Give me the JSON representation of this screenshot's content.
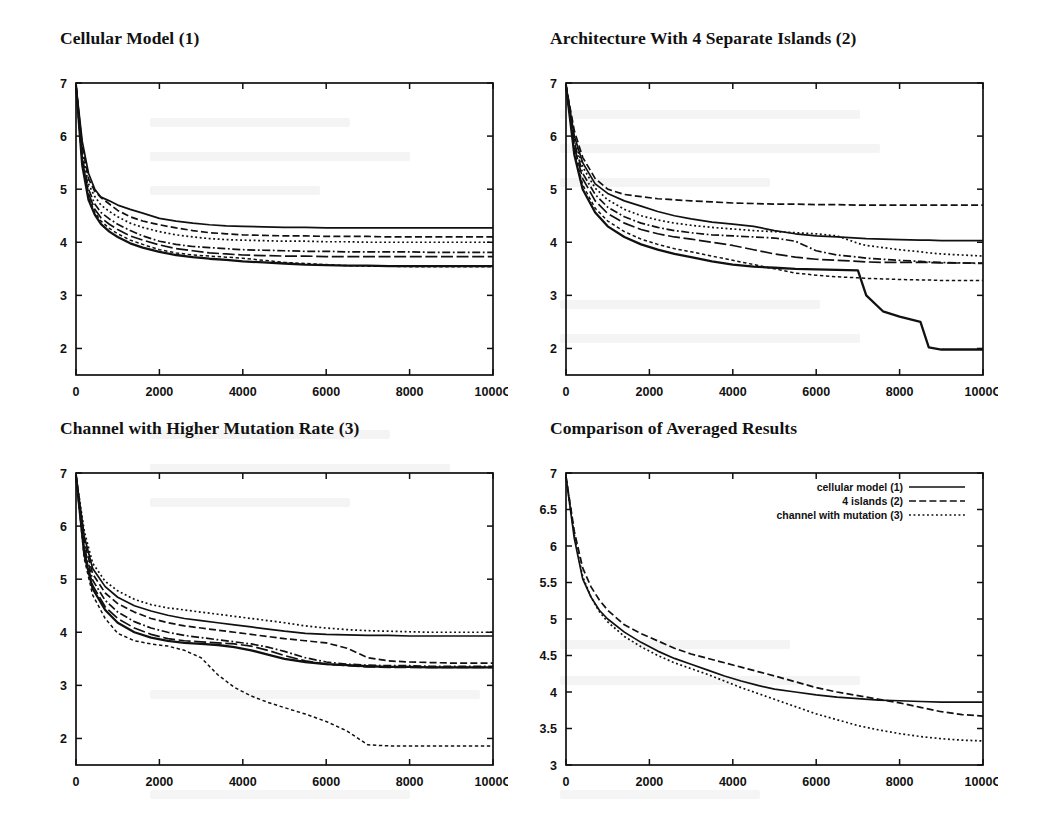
{
  "figure": {
    "background_color": "#ffffff",
    "ink_color": "#111111"
  },
  "panels": [
    {
      "id": "cellular-model",
      "title": "Cellular Model (1)"
    },
    {
      "id": "four-islands",
      "title": "Architecture With 4 Separate Islands (2)"
    },
    {
      "id": "channel-mutation",
      "title": "Channel with Higher Mutation Rate (3)"
    },
    {
      "id": "comparison",
      "title": "Comparison of Averaged Results"
    }
  ],
  "axes": {
    "x_tick_labels": [
      "0",
      "2000",
      "4000",
      "6000",
      "8000",
      "1000C"
    ],
    "x_tick_values": [
      0,
      2000,
      4000,
      6000,
      8000,
      10000
    ],
    "y_tick_labels_runs": [
      "2",
      "3",
      "4",
      "5",
      "6",
      "7"
    ],
    "y_tick_values_runs": [
      2,
      3,
      4,
      5,
      6,
      7
    ],
    "y_tick_labels_comparison": [
      "3",
      "3.5",
      "4",
      "4.5",
      "5",
      "5.5",
      "6",
      "6.5",
      "7"
    ],
    "y_tick_values_comparison": [
      3,
      3.5,
      4,
      4.5,
      5,
      5.5,
      6,
      6.5,
      7
    ]
  },
  "legend": {
    "position": "top-right-inside",
    "entries": [
      {
        "label": "cellular model (1)",
        "dash": "solid"
      },
      {
        "label": "4 islands (2)",
        "dash": "dash"
      },
      {
        "label": "channel with mutation (3)",
        "dash": "dot"
      }
    ]
  },
  "chart_data": [
    {
      "type": "line",
      "title": "Cellular Model (1)",
      "xlabel": "",
      "ylabel": "",
      "xlim": [
        0,
        10000
      ],
      "ylim": [
        1.5,
        7
      ],
      "grid": false,
      "legend": "none",
      "x": [
        0,
        150,
        300,
        450,
        600,
        800,
        1000,
        1300,
        1600,
        2000,
        2400,
        2800,
        3200,
        3600,
        4000,
        4500,
        5000,
        5500,
        6000,
        6500,
        7000,
        7500,
        8000,
        8500,
        9000,
        9500,
        10000
      ],
      "series": [
        {
          "name": "run 1",
          "dash": "solid",
          "values": [
            6.95,
            5.9,
            5.3,
            5.0,
            4.85,
            4.78,
            4.7,
            4.62,
            4.55,
            4.45,
            4.4,
            4.36,
            4.33,
            4.31,
            4.3,
            4.29,
            4.28,
            4.28,
            4.27,
            4.27,
            4.27,
            4.27,
            4.27,
            4.27,
            4.27,
            4.27,
            4.27
          ]
        },
        {
          "name": "run 2",
          "dash": "dash",
          "values": [
            6.95,
            5.8,
            5.2,
            4.96,
            4.84,
            4.72,
            4.6,
            4.48,
            4.4,
            4.33,
            4.27,
            4.22,
            4.18,
            4.16,
            4.14,
            4.13,
            4.12,
            4.12,
            4.11,
            4.11,
            4.11,
            4.1,
            4.1,
            4.1,
            4.1,
            4.1,
            4.1
          ]
        },
        {
          "name": "run 3",
          "dash": "dot",
          "values": [
            6.95,
            5.7,
            5.1,
            4.86,
            4.7,
            4.58,
            4.48,
            4.36,
            4.28,
            4.2,
            4.14,
            4.1,
            4.07,
            4.05,
            4.04,
            4.03,
            4.02,
            4.02,
            4.01,
            4.01,
            4.0,
            4.0,
            4.0,
            4.0,
            4.0,
            4.0,
            4.0
          ]
        },
        {
          "name": "run 4",
          "dash": "dashdot",
          "values": [
            6.95,
            5.6,
            5.0,
            4.72,
            4.56,
            4.44,
            4.34,
            4.22,
            4.12,
            4.02,
            3.96,
            3.92,
            3.9,
            3.88,
            3.86,
            3.85,
            3.84,
            3.83,
            3.83,
            3.82,
            3.82,
            3.82,
            3.82,
            3.81,
            3.81,
            3.81,
            3.81
          ]
        },
        {
          "name": "run 5",
          "dash": "longdash",
          "values": [
            6.95,
            5.55,
            4.92,
            4.62,
            4.46,
            4.34,
            4.24,
            4.12,
            4.04,
            3.95,
            3.88,
            3.84,
            3.8,
            3.78,
            3.76,
            3.75,
            3.74,
            3.74,
            3.73,
            3.73,
            3.73,
            3.73,
            3.73,
            3.73,
            3.73,
            3.73,
            3.73
          ]
        },
        {
          "name": "run 6",
          "dash": "fine",
          "values": [
            6.95,
            5.5,
            4.86,
            4.56,
            4.4,
            4.26,
            4.16,
            4.04,
            3.96,
            3.86,
            3.8,
            3.76,
            3.74,
            3.72,
            3.7,
            3.66,
            3.62,
            3.6,
            3.58,
            3.56,
            3.55,
            3.55,
            3.54,
            3.54,
            3.54,
            3.54,
            3.54
          ]
        },
        {
          "name": "run 7",
          "dash": "thick",
          "values": [
            6.95,
            5.45,
            4.8,
            4.52,
            4.34,
            4.2,
            4.1,
            3.98,
            3.9,
            3.82,
            3.76,
            3.72,
            3.69,
            3.67,
            3.64,
            3.62,
            3.6,
            3.58,
            3.57,
            3.56,
            3.56,
            3.55,
            3.55,
            3.55,
            3.55,
            3.55,
            3.55
          ]
        }
      ]
    },
    {
      "type": "line",
      "title": "Architecture With 4 Separate Islands (2)",
      "xlabel": "",
      "ylabel": "",
      "xlim": [
        0,
        10000
      ],
      "ylim": [
        1.5,
        7
      ],
      "grid": false,
      "legend": "none",
      "x": [
        0,
        200,
        400,
        700,
        1000,
        1400,
        1800,
        2200,
        2600,
        3000,
        3500,
        4000,
        4500,
        5000,
        5500,
        6000,
        6500,
        7000,
        7200,
        7600,
        8000,
        8500,
        8700,
        9000,
        9500,
        10000
      ],
      "series": [
        {
          "name": "run 1",
          "dash": "dash",
          "values": [
            6.95,
            6.1,
            5.6,
            5.2,
            5.0,
            4.9,
            4.86,
            4.82,
            4.8,
            4.78,
            4.76,
            4.74,
            4.73,
            4.72,
            4.72,
            4.71,
            4.71,
            4.7,
            4.7,
            4.7,
            4.7,
            4.7,
            4.7,
            4.7,
            4.7,
            4.7
          ]
        },
        {
          "name": "run 2",
          "dash": "solid",
          "values": [
            6.95,
            6.0,
            5.5,
            5.1,
            4.92,
            4.78,
            4.68,
            4.58,
            4.5,
            4.44,
            4.38,
            4.34,
            4.3,
            4.22,
            4.16,
            4.12,
            4.1,
            4.08,
            4.07,
            4.06,
            4.05,
            4.04,
            4.04,
            4.03,
            4.03,
            4.03
          ]
        },
        {
          "name": "run 3",
          "dash": "dot",
          "values": [
            6.95,
            5.95,
            5.42,
            5.02,
            4.8,
            4.62,
            4.5,
            4.42,
            4.36,
            4.32,
            4.28,
            4.25,
            4.22,
            4.2,
            4.18,
            4.16,
            4.12,
            3.98,
            3.94,
            3.9,
            3.86,
            3.82,
            3.8,
            3.78,
            3.76,
            3.74
          ]
        },
        {
          "name": "run 4",
          "dash": "dashdot",
          "values": [
            6.95,
            5.88,
            5.3,
            4.9,
            4.66,
            4.48,
            4.36,
            4.28,
            4.22,
            4.18,
            4.14,
            4.12,
            4.1,
            4.08,
            4.02,
            3.84,
            3.76,
            3.72,
            3.7,
            3.68,
            3.66,
            3.64,
            3.63,
            3.62,
            3.61,
            3.6
          ]
        },
        {
          "name": "run 5",
          "dash": "longdash",
          "values": [
            6.95,
            5.8,
            5.2,
            4.78,
            4.54,
            4.36,
            4.24,
            4.16,
            4.1,
            4.06,
            4.0,
            3.94,
            3.86,
            3.78,
            3.72,
            3.68,
            3.66,
            3.64,
            3.63,
            3.62,
            3.62,
            3.62,
            3.62,
            3.61,
            3.61,
            3.61
          ]
        },
        {
          "name": "run 6",
          "dash": "fine",
          "values": [
            6.95,
            5.72,
            5.08,
            4.64,
            4.4,
            4.2,
            4.06,
            3.96,
            3.88,
            3.82,
            3.74,
            3.66,
            3.58,
            3.5,
            3.42,
            3.38,
            3.35,
            3.33,
            3.32,
            3.31,
            3.3,
            3.29,
            3.29,
            3.28,
            3.28,
            3.28
          ]
        },
        {
          "name": "run 7",
          "dash": "thick",
          "values": [
            6.95,
            5.65,
            5.0,
            4.56,
            4.3,
            4.1,
            3.96,
            3.86,
            3.78,
            3.72,
            3.64,
            3.58,
            3.54,
            3.52,
            3.5,
            3.49,
            3.48,
            3.47,
            3.0,
            2.7,
            2.6,
            2.5,
            2.02,
            1.98,
            1.98,
            1.98
          ]
        }
      ]
    },
    {
      "type": "line",
      "title": "Channel with Higher Mutation Rate (3)",
      "xlabel": "",
      "ylabel": "",
      "xlim": [
        0,
        10000
      ],
      "ylim": [
        1.5,
        7
      ],
      "grid": false,
      "legend": "none",
      "x": [
        0,
        200,
        400,
        700,
        1000,
        1400,
        1800,
        2200,
        2600,
        3000,
        3400,
        3800,
        4200,
        4600,
        5000,
        5500,
        6000,
        6500,
        7000,
        7500,
        8000,
        8500,
        9000,
        9500,
        10000
      ],
      "series": [
        {
          "name": "run 1",
          "dash": "dot",
          "values": [
            6.95,
            5.9,
            5.3,
            4.96,
            4.78,
            4.62,
            4.52,
            4.46,
            4.42,
            4.38,
            4.34,
            4.3,
            4.26,
            4.22,
            4.18,
            4.12,
            4.08,
            4.05,
            4.03,
            4.02,
            4.01,
            4.0,
            4.0,
            4.0,
            4.0
          ]
        },
        {
          "name": "run 2",
          "dash": "solid",
          "values": [
            6.95,
            5.8,
            5.2,
            4.86,
            4.66,
            4.5,
            4.4,
            4.32,
            4.26,
            4.22,
            4.18,
            4.14,
            4.1,
            4.06,
            4.02,
            3.98,
            3.96,
            3.95,
            3.94,
            3.94,
            3.93,
            3.93,
            3.93,
            3.93,
            3.93
          ]
        },
        {
          "name": "run 3",
          "dash": "dash",
          "values": [
            6.95,
            5.7,
            5.1,
            4.74,
            4.54,
            4.38,
            4.26,
            4.18,
            4.12,
            4.08,
            4.04,
            4.0,
            3.96,
            3.92,
            3.88,
            3.84,
            3.8,
            3.7,
            3.52,
            3.46,
            3.44,
            3.43,
            3.42,
            3.42,
            3.42
          ]
        },
        {
          "name": "run 4",
          "dash": "dashdot",
          "values": [
            6.95,
            5.6,
            4.98,
            4.6,
            4.38,
            4.2,
            4.08,
            4.0,
            3.94,
            3.9,
            3.86,
            3.82,
            3.78,
            3.72,
            3.64,
            3.52,
            3.44,
            3.4,
            3.38,
            3.37,
            3.37,
            3.36,
            3.36,
            3.36,
            3.36
          ]
        },
        {
          "name": "run 5",
          "dash": "longdash",
          "values": [
            6.95,
            5.52,
            4.88,
            4.48,
            4.26,
            4.08,
            3.96,
            3.88,
            3.84,
            3.82,
            3.8,
            3.78,
            3.74,
            3.66,
            3.56,
            3.46,
            3.4,
            3.37,
            3.35,
            3.34,
            3.34,
            3.34,
            3.34,
            3.34,
            3.34
          ]
        },
        {
          "name": "run 6",
          "dash": "thick",
          "values": [
            6.95,
            5.46,
            4.82,
            4.42,
            4.18,
            4.0,
            3.9,
            3.84,
            3.8,
            3.78,
            3.76,
            3.72,
            3.66,
            3.58,
            3.5,
            3.44,
            3.4,
            3.38,
            3.36,
            3.35,
            3.35,
            3.34,
            3.34,
            3.34,
            3.34
          ]
        },
        {
          "name": "run 7",
          "dash": "fine",
          "values": [
            6.95,
            5.38,
            4.7,
            4.26,
            3.98,
            3.84,
            3.78,
            3.74,
            3.66,
            3.52,
            3.2,
            2.96,
            2.8,
            2.68,
            2.58,
            2.46,
            2.32,
            2.14,
            1.88,
            1.86,
            1.86,
            1.86,
            1.86,
            1.86,
            1.86
          ]
        }
      ]
    },
    {
      "type": "line",
      "title": "Comparison of Averaged Results",
      "xlabel": "",
      "ylabel": "",
      "xlim": [
        0,
        10000
      ],
      "ylim": [
        3,
        7
      ],
      "grid": false,
      "legend": "top-right-inside",
      "x": [
        0,
        200,
        400,
        600,
        800,
        1000,
        1400,
        1800,
        2200,
        2600,
        3000,
        3400,
        3800,
        4200,
        4600,
        5000,
        5500,
        6000,
        6500,
        7000,
        7500,
        8000,
        8500,
        9000,
        9500,
        10000
      ],
      "series": [
        {
          "name": "cellular model (1)",
          "dash": "solid",
          "values": [
            6.95,
            6.1,
            5.55,
            5.3,
            5.12,
            5.0,
            4.82,
            4.68,
            4.56,
            4.46,
            4.38,
            4.3,
            4.22,
            4.15,
            4.09,
            4.04,
            4.0,
            3.96,
            3.93,
            3.91,
            3.89,
            3.88,
            3.87,
            3.86,
            3.86,
            3.86
          ]
        },
        {
          "name": "4 islands (2)",
          "dash": "dash",
          "values": [
            6.95,
            6.2,
            5.7,
            5.44,
            5.26,
            5.12,
            4.92,
            4.8,
            4.7,
            4.6,
            4.52,
            4.46,
            4.4,
            4.34,
            4.28,
            4.22,
            4.14,
            4.06,
            4.0,
            3.95,
            3.9,
            3.85,
            3.79,
            3.73,
            3.69,
            3.67
          ]
        },
        {
          "name": "channel with mutation (3)",
          "dash": "dot",
          "values": [
            6.95,
            6.15,
            5.58,
            5.3,
            5.1,
            4.96,
            4.76,
            4.62,
            4.5,
            4.4,
            4.32,
            4.24,
            4.15,
            4.06,
            3.98,
            3.9,
            3.8,
            3.7,
            3.62,
            3.54,
            3.48,
            3.43,
            3.39,
            3.36,
            3.34,
            3.33
          ]
        }
      ]
    }
  ]
}
